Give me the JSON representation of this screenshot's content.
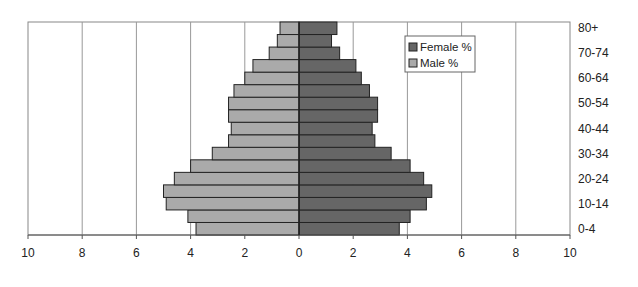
{
  "chart_data": {
    "type": "bar",
    "orientation": "horizontal",
    "subtype": "population-pyramid",
    "title": "",
    "xlabel": "",
    "ylabel": "",
    "xlim": [
      -10,
      10
    ],
    "x_ticks": [
      -10,
      -8,
      -6,
      -4,
      -2,
      0,
      2,
      4,
      6,
      8,
      10
    ],
    "x_tick_labels": [
      "10",
      "8",
      "6",
      "4",
      "2",
      "0",
      "2",
      "4",
      "6",
      "8",
      "10"
    ],
    "grid": true,
    "legend_position": "top-right",
    "categories": [
      "0-4",
      "5-9",
      "10-14",
      "15-19",
      "20-24",
      "25-29",
      "30-34",
      "35-39",
      "40-44",
      "45-49",
      "50-54",
      "55-59",
      "60-64",
      "65-69",
      "70-74",
      "75-79",
      "80+"
    ],
    "category_tick_labels": [
      "0-4",
      "10-14",
      "20-24",
      "30-34",
      "40-44",
      "50-54",
      "60-64",
      "70-74",
      "80+"
    ],
    "series": [
      {
        "name": "Female %",
        "side": "right",
        "color": "#666666",
        "values": [
          3.7,
          4.1,
          4.7,
          4.9,
          4.6,
          4.1,
          3.4,
          2.8,
          2.7,
          2.9,
          2.9,
          2.6,
          2.3,
          2.1,
          1.5,
          1.2,
          1.4
        ]
      },
      {
        "name": "Male %",
        "side": "left",
        "color": "#aaaaaa",
        "values": [
          3.8,
          4.1,
          4.9,
          5.0,
          4.6,
          4.0,
          3.2,
          2.6,
          2.5,
          2.6,
          2.6,
          2.4,
          2.0,
          1.7,
          1.1,
          0.8,
          0.7
        ]
      }
    ],
    "legend": [
      "Female %",
      "Male %"
    ]
  }
}
